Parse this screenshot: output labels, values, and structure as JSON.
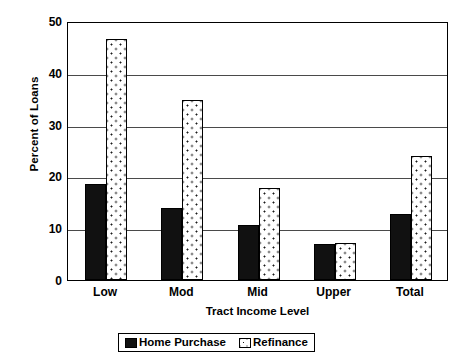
{
  "chart_data": {
    "type": "bar",
    "title": "",
    "subtitle": "",
    "xlabel": "Tract Income Level",
    "ylabel": "Percent of Loans",
    "categories": [
      "Low",
      "Mod",
      "Mid",
      "Upper",
      "Total"
    ],
    "series": [
      {
        "name": "Home Purchase",
        "values": [
          18.5,
          13.9,
          10.6,
          6.9,
          12.7
        ],
        "color": "#111111",
        "fill": "solid-black"
      },
      {
        "name": "Refinance",
        "values": [
          46.6,
          34.7,
          17.8,
          7.1,
          24.0
        ],
        "color": "#ffffff",
        "fill": "dotted-white"
      }
    ],
    "ylim": [
      0,
      50
    ],
    "yticks": [
      0,
      10,
      20,
      30,
      40,
      50
    ],
    "ytick_labels": [
      "0",
      "10",
      "20",
      "30",
      "40",
      "50"
    ],
    "grid": "horizontal",
    "legend_position": "bottom-center",
    "axis_color": "#000000",
    "grid_color": "#4a4a4a",
    "background": "#ffffff"
  },
  "legend": {
    "entries": [
      {
        "label": "Home Purchase"
      },
      {
        "label": "Refinance"
      }
    ]
  }
}
